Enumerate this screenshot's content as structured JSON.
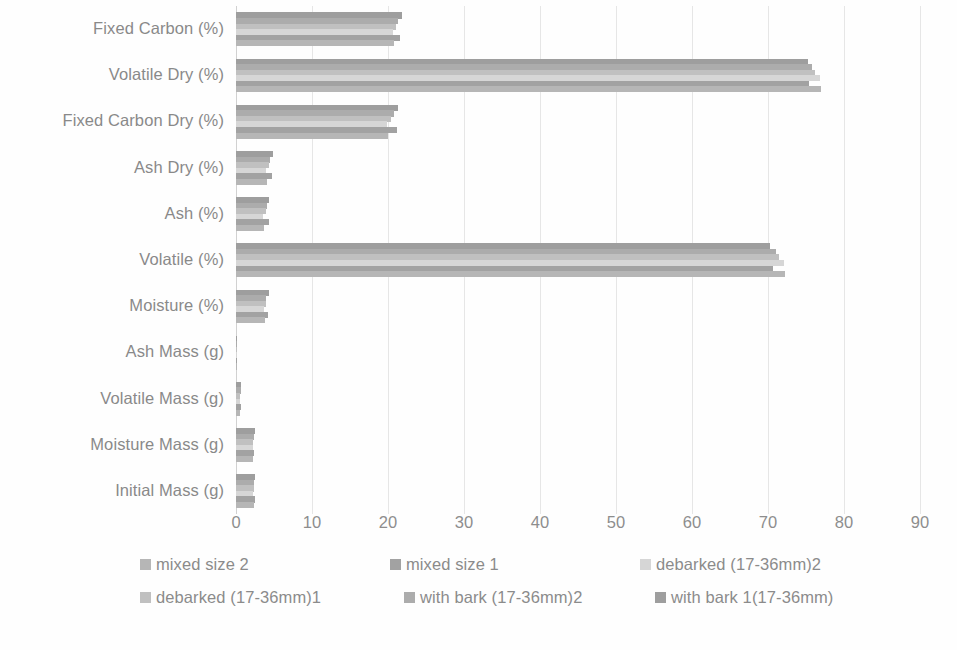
{
  "chart_data": {
    "type": "bar",
    "orientation": "horizontal",
    "title": "",
    "xlabel": "",
    "ylabel": "",
    "xlim": [
      0,
      90
    ],
    "xticks": [
      0,
      10,
      20,
      30,
      40,
      50,
      60,
      70,
      80,
      90
    ],
    "grid": true,
    "legend_position": "bottom",
    "categories": [
      "Fixed Carbon (%)",
      "Volatile Dry (%)",
      "Fixed Carbon Dry (%)",
      "Ash Dry (%)",
      "Ash (%)",
      "Volatile (%)",
      "Moisture (%)",
      "Ash Mass (g)",
      "Volatile Mass (g)",
      "Moisture Mass (g)",
      "Initial Mass (g)"
    ],
    "series": [
      {
        "name": "mixed size 2",
        "color": "#a8a8a8",
        "values": [
          20.8,
          77.0,
          20.0,
          4.1,
          3.7,
          72.3,
          3.8,
          0.1,
          0.5,
          2.3,
          2.4
        ]
      },
      {
        "name": "mixed size 1",
        "color": "#8f8f8f",
        "values": [
          21.6,
          75.4,
          21.2,
          4.8,
          4.3,
          70.6,
          4.2,
          0.1,
          0.6,
          2.4,
          2.5
        ]
      },
      {
        "name": "debarked (17-36mm)2",
        "color": "#cfcfcf",
        "values": [
          20.6,
          76.8,
          19.9,
          4.0,
          3.6,
          72.1,
          3.7,
          0.1,
          0.5,
          2.2,
          2.3
        ]
      },
      {
        "name": "debarked (17-36mm)1",
        "color": "#b4b4b4",
        "values": [
          21.0,
          76.2,
          20.4,
          4.3,
          3.9,
          71.5,
          3.9,
          0.1,
          0.5,
          2.3,
          2.4
        ]
      },
      {
        "name": "with bark (17-36mm)2",
        "color": "#9c9c9c",
        "values": [
          21.3,
          75.8,
          20.8,
          4.5,
          4.1,
          71.0,
          4.0,
          0.1,
          0.6,
          2.4,
          2.4
        ]
      },
      {
        "name": "with bark 1(17-36mm)",
        "color": "#8a8a8a",
        "values": [
          21.8,
          75.2,
          21.3,
          4.9,
          4.4,
          70.3,
          4.3,
          0.1,
          0.6,
          2.5,
          2.5
        ]
      }
    ]
  }
}
